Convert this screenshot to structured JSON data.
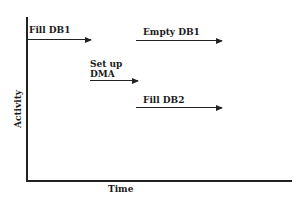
{
  "diagram": {
    "type": "timing-diagram",
    "axes": {
      "y_label": "Activity",
      "x_label": "Time"
    },
    "activities": [
      {
        "label": "Fill DB1",
        "order": 1
      },
      {
        "label": "Empty DB1",
        "order": 2
      },
      {
        "label": "Set up\nDMA",
        "line1": "Set up",
        "line2": "DMA",
        "order": 3
      },
      {
        "label": "Fill DB2",
        "order": 4
      }
    ],
    "colors": {
      "ink": "#222222",
      "background": "#ffffff"
    }
  }
}
